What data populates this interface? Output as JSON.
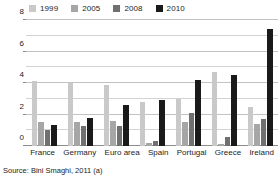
{
  "source_note": "Source: Bini Smaghi, 2011 (a)",
  "chart_data": {
    "type": "bar",
    "title": "",
    "xlabel": "",
    "ylabel": "",
    "ylim": [
      0,
      8
    ],
    "yticks": [
      0,
      2,
      4,
      6,
      8
    ],
    "ytick_labels": [
      "0",
      "2",
      "4",
      "6",
      "8"
    ],
    "gridlines": [
      0,
      1,
      2,
      3,
      4,
      5,
      6,
      7,
      8
    ],
    "grid": true,
    "legend_position": "top-left",
    "categories": [
      "France",
      "Germany",
      "Euro area",
      "Spain",
      "Portugal",
      "Greece",
      "Ireland"
    ],
    "series": [
      {
        "name": "1999",
        "color": "#c9c9c9",
        "values": [
          4.1,
          4.0,
          3.9,
          2.8,
          3.0,
          4.7,
          2.5
        ]
      },
      {
        "name": "2005",
        "color": "#a6a6a6",
        "values": [
          1.55,
          1.5,
          1.6,
          0.2,
          1.5,
          0.1,
          1.4
        ]
      },
      {
        "name": "2008",
        "color": "#707070",
        "values": [
          1.0,
          1.3,
          1.3,
          0.3,
          2.1,
          0.6,
          1.7
        ]
      },
      {
        "name": "2010",
        "color": "#1a1a1a",
        "values": [
          1.35,
          1.8,
          2.6,
          2.9,
          4.2,
          4.5,
          7.4
        ]
      }
    ]
  }
}
